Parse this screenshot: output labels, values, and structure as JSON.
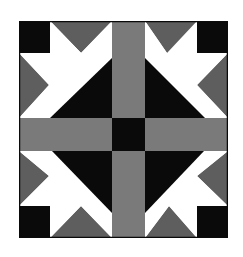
{
  "image": {
    "subject": "quilt-block",
    "description": "Quilt block with four white arrows pointing to the corners, black corner squares, gray sashing cross and black center square"
  },
  "colors": {
    "background": "#ffffff",
    "black": "#0a0a0a",
    "gray": "#7a7a7a",
    "dark_gray": "#5e5e5e",
    "white": "#ffffff"
  },
  "layout": {
    "width": 209,
    "height": 217,
    "band": 33,
    "corner": 31
  }
}
